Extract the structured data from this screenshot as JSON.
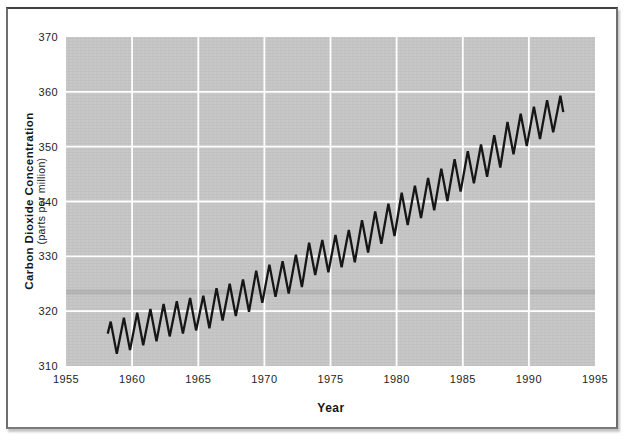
{
  "colors": {
    "page_bg": "#ffffff",
    "frame_border": "#5c5c5c",
    "plot_bg": "#c5c5c5",
    "gridline": "#ffffff",
    "line": "#161616",
    "text": "#1d1d1d",
    "scan_band": "rgba(0,0,0,0.085)"
  },
  "chart_data": {
    "type": "line",
    "title": "",
    "xlabel": "Year",
    "ylabel": "Carbon Dioxide Concentration",
    "ylabel_sub": "(parts per million)",
    "xlim": [
      1955,
      1995
    ],
    "ylim": [
      310,
      370
    ],
    "x_ticks": [
      1955,
      1960,
      1965,
      1970,
      1975,
      1980,
      1985,
      1990,
      1995
    ],
    "y_ticks": [
      370,
      360,
      350,
      340,
      330,
      320,
      310
    ],
    "grid": true,
    "legend": "none",
    "scan_band_ppm": 323.5,
    "series": [
      {
        "name": "Atmospheric CO2, Mauna Loa record",
        "years": [
          1958,
          1959,
          1960,
          1961,
          1962,
          1963,
          1964,
          1965,
          1966,
          1967,
          1968,
          1969,
          1970,
          1971,
          1972,
          1973,
          1974,
          1975,
          1976,
          1977,
          1978,
          1979,
          1980,
          1981,
          1982,
          1983,
          1984,
          1985,
          1986,
          1987,
          1988,
          1989,
          1990,
          1991,
          1992
        ],
        "annual_mean_ppm": [
          315.3,
          316.0,
          316.9,
          317.6,
          318.5,
          319.0,
          319.6,
          320.0,
          321.4,
          322.2,
          323.0,
          324.6,
          325.7,
          326.3,
          327.5,
          329.7,
          330.2,
          331.1,
          332.0,
          333.8,
          335.4,
          336.8,
          338.8,
          340.1,
          341.5,
          343.2,
          344.9,
          346.4,
          347.6,
          349.3,
          351.7,
          353.2,
          354.5,
          355.7,
          356.5
        ],
        "seasonal_peak_offset_ppm": 2.8,
        "seasonal_trough_offset_ppm": 3.1,
        "peak_phase": 0.38,
        "trough_phase": 0.84,
        "line_start": [
          1958.15,
          315.9
        ],
        "line_end": [
          1992.6,
          356.3
        ]
      }
    ]
  }
}
